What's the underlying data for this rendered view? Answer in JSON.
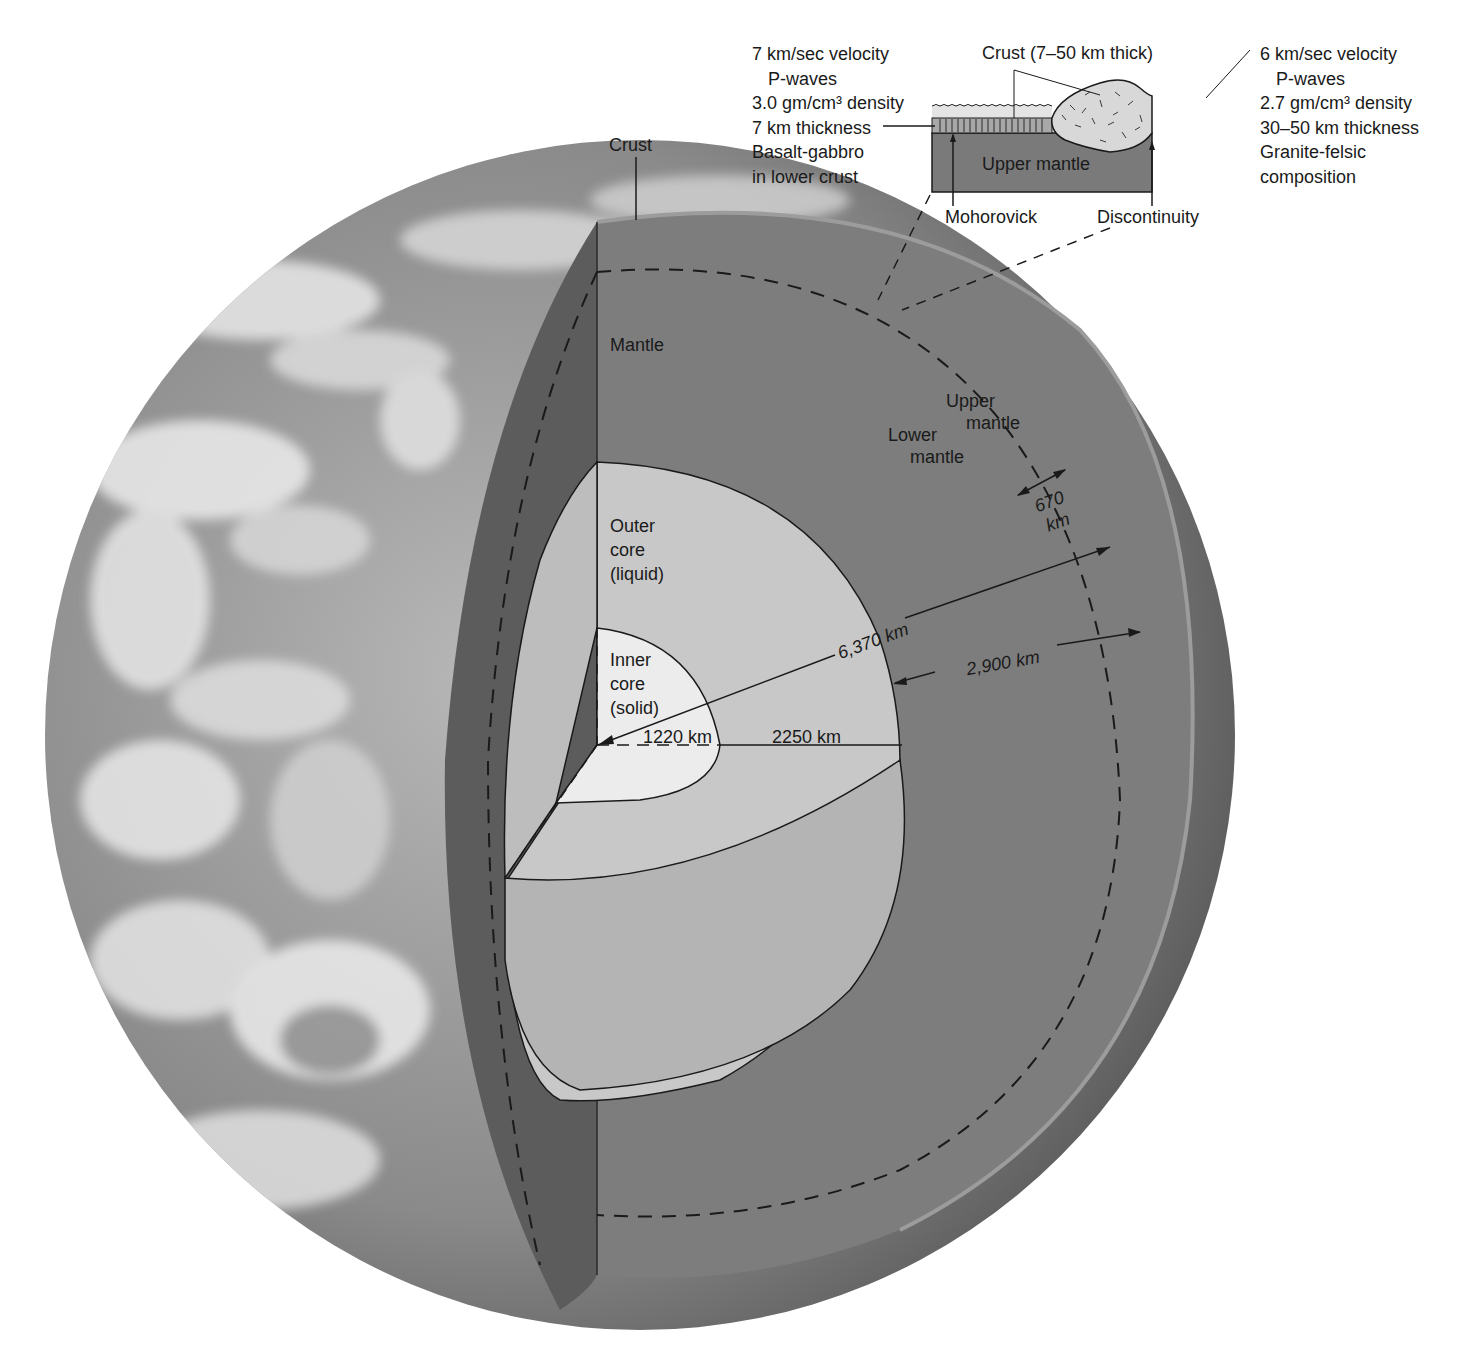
{
  "figure": {
    "colors": {
      "background": "#ffffff",
      "earth_photo_base": "#8c8c8c",
      "earth_photo_clouds": "#e6e6e6",
      "crust_edge": "#5e5e5e",
      "mantle": "#7d7d7d",
      "outer_core": "#c4c4c4",
      "inner_core": "#ececec",
      "outer_core_lower": "#b0b0b0",
      "inset_upper_mantle": "#7a7a7a",
      "inset_continental_crust": "#d8d8d8",
      "inset_oceanic_crust": "#a8a8a8",
      "inset_water": "#e4e4e4"
    }
  },
  "labels": {
    "crust": "Crust",
    "mantle": "Mantle",
    "upper_mantle": [
      "Upper",
      "mantle"
    ],
    "lower_mantle": [
      "Lower",
      "mantle"
    ],
    "depth_670": [
      "670",
      "km"
    ],
    "outer_core": [
      "Outer",
      "core",
      "(liquid)"
    ],
    "inner_core": [
      "Inner",
      "core",
      "(solid)"
    ],
    "radius_earth": "6,370 km",
    "mantle_thickness": "2,900 km",
    "inner_core_radius": "1220 km",
    "outer_core_thickness": "2250 km"
  },
  "inset": {
    "crust_label": "Crust (7–50 km thick)",
    "upper_mantle_label": "Upper mantle",
    "mohorovick_label": "Mohorovick",
    "discontinuity_label": "Discontinuity",
    "oceanic": {
      "lines": [
        "7 km/sec velocity",
        "P-waves",
        "3.0 gm/cm³ density",
        "7 km thickness",
        "Basalt-gabbro",
        "in lower crust"
      ]
    },
    "continental": {
      "lines": [
        "6 km/sec velocity",
        "P-waves",
        "2.7 gm/cm³ density",
        "30–50 km thickness",
        "Granite-felsic",
        "composition"
      ]
    }
  }
}
